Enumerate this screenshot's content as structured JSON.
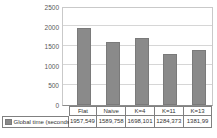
{
  "chart_data": {
    "type": "bar",
    "title": "",
    "categories": [
      "Flat",
      "Naive",
      "K=4",
      "K=11",
      "K=13"
    ],
    "series": [
      {
        "name": "Global time (seconds)",
        "values": [
          1957.549,
          1589.758,
          1698.101,
          1284.373,
          1381.99
        ]
      }
    ],
    "value_labels": [
      "1957,549",
      "1589,758",
      "1698,101",
      "1284,373",
      "1381,99"
    ],
    "yticks": [
      0,
      500,
      1000,
      1500,
      2000,
      2500
    ],
    "ytick_labels": [
      "0",
      "500",
      "1000",
      "1500",
      "2000",
      "2500"
    ],
    "ylim": [
      0,
      2500
    ],
    "xlabel": "",
    "ylabel": "",
    "grid": true,
    "legend_position": "data-table",
    "bar_color": "#8a8a8a"
  },
  "legend": {
    "label": "Global time (seconds)",
    "marker_color": "#8a8a8a"
  }
}
